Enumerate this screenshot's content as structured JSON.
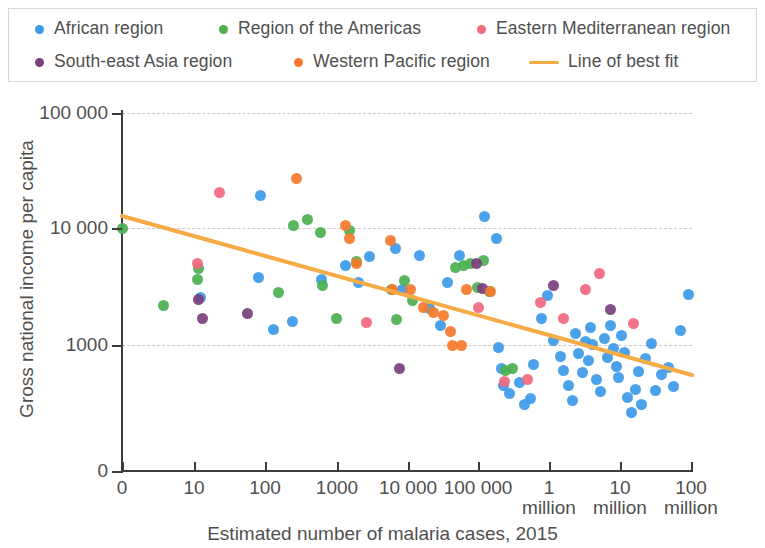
{
  "legend": {
    "items": [
      {
        "label": "African region",
        "color": "#3d9ae8",
        "marker": "dot",
        "name": "legend-item-african-region"
      },
      {
        "label": "Region of the Americas",
        "color": "#4cb050",
        "marker": "dot",
        "name": "legend-item-americas"
      },
      {
        "label": "Eastern Mediterranean region",
        "color": "#f2687f",
        "marker": "dot",
        "name": "legend-item-eastern-mediterranean"
      },
      {
        "label": "South-east Asia region",
        "color": "#7b3f7f",
        "marker": "dot",
        "name": "legend-item-south-east-asia"
      },
      {
        "label": "Western Pacific region",
        "color": "#f5792c",
        "marker": "dot",
        "name": "legend-item-western-pacific"
      },
      {
        "label": "Line of best fit",
        "color": "#f5ab46",
        "marker": "line",
        "name": "legend-item-line-of-best-fit"
      }
    ]
  },
  "chart_data": {
    "type": "scatter",
    "title": "",
    "xlabel": "Estimated number of malaria cases, 2015",
    "ylabel": "Gross national income per capita",
    "x_scale": "log",
    "y_scale": "log",
    "grid": true,
    "legend_position": "top",
    "x_ticks": [
      {
        "label": "0",
        "sub": "",
        "px": 122
      },
      {
        "label": "10",
        "sub": "",
        "px": 194
      },
      {
        "label": "100",
        "sub": "",
        "px": 265
      },
      {
        "label": "1000",
        "sub": "",
        "px": 337
      },
      {
        "label": "10 000",
        "sub": "",
        "px": 408
      },
      {
        "label": "100 000",
        "sub": "",
        "px": 478
      },
      {
        "label": "1",
        "sub": "million",
        "px": 549
      },
      {
        "label": "10",
        "sub": "million",
        "px": 620
      },
      {
        "label": "100",
        "sub": "million",
        "px": 691
      }
    ],
    "y_ticks": [
      {
        "label": "100 000",
        "px": 113
      },
      {
        "label": "10 000",
        "px": 228
      },
      {
        "label": "1000",
        "px": 345
      },
      {
        "label": "0",
        "px": 471
      }
    ],
    "gridlines_y": [
      113,
      228,
      345
    ],
    "line_of_best_fit": {
      "color": "#f5ab46",
      "width": 4,
      "x1": 122,
      "y1": 216,
      "x2": 692,
      "y2": 375
    },
    "series": [
      {
        "name": "African region",
        "color": "#3d9ae8",
        "points": [
          [
            200,
            297
          ],
          [
            260,
            195
          ],
          [
            258,
            277
          ],
          [
            273,
            329
          ],
          [
            292,
            321
          ],
          [
            321,
            279
          ],
          [
            345,
            265
          ],
          [
            358,
            282
          ],
          [
            369,
            256
          ],
          [
            395,
            248
          ],
          [
            402,
            289
          ],
          [
            419,
            255
          ],
          [
            429,
            308
          ],
          [
            440,
            325
          ],
          [
            447,
            282
          ],
          [
            459,
            255
          ],
          [
            484,
            216
          ],
          [
            496,
            238
          ],
          [
            498,
            347
          ],
          [
            501,
            368
          ],
          [
            503,
            385
          ],
          [
            509,
            393
          ],
          [
            519,
            382
          ],
          [
            524,
            404
          ],
          [
            530,
            398
          ],
          [
            533,
            364
          ],
          [
            541,
            318
          ],
          [
            547,
            295
          ],
          [
            553,
            340
          ],
          [
            560,
            356
          ],
          [
            563,
            370
          ],
          [
            568,
            385
          ],
          [
            572,
            400
          ],
          [
            575,
            333
          ],
          [
            578,
            353
          ],
          [
            582,
            372
          ],
          [
            585,
            341
          ],
          [
            588,
            360
          ],
          [
            590,
            327
          ],
          [
            592,
            344
          ],
          [
            596,
            379
          ],
          [
            600,
            391
          ],
          [
            604,
            338
          ],
          [
            607,
            357
          ],
          [
            610,
            325
          ],
          [
            613,
            348
          ],
          [
            616,
            366
          ],
          [
            618,
            377
          ],
          [
            621,
            335
          ],
          [
            624,
            352
          ],
          [
            627,
            397
          ],
          [
            631,
            412
          ],
          [
            635,
            389
          ],
          [
            638,
            371
          ],
          [
            641,
            404
          ],
          [
            645,
            358
          ],
          [
            651,
            343
          ],
          [
            655,
            390
          ],
          [
            661,
            374
          ],
          [
            668,
            367
          ],
          [
            673,
            386
          ],
          [
            680,
            330
          ],
          [
            688,
            294
          ]
        ]
      },
      {
        "name": "Region of the Americas",
        "color": "#4cb050",
        "points": [
          [
            122,
            228
          ],
          [
            163,
            305
          ],
          [
            197,
            279
          ],
          [
            198,
            268
          ],
          [
            278,
            292
          ],
          [
            293,
            225
          ],
          [
            307,
            219
          ],
          [
            320,
            232
          ],
          [
            322,
            285
          ],
          [
            336,
            318
          ],
          [
            349,
            230
          ],
          [
            356,
            261
          ],
          [
            391,
            289
          ],
          [
            396,
            319
          ],
          [
            404,
            280
          ],
          [
            412,
            300
          ],
          [
            455,
            267
          ],
          [
            463,
            265
          ],
          [
            470,
            263
          ],
          [
            477,
            287
          ],
          [
            483,
            260
          ],
          [
            489,
            291
          ],
          [
            505,
            370
          ],
          [
            512,
            368
          ]
        ]
      },
      {
        "name": "Eastern Mediterranean region",
        "color": "#f2687f",
        "points": [
          [
            219,
            192
          ],
          [
            197,
            263
          ],
          [
            366,
            322
          ],
          [
            478,
            307
          ],
          [
            504,
            381
          ],
          [
            527,
            379
          ],
          [
            540,
            302
          ],
          [
            563,
            318
          ],
          [
            585,
            289
          ],
          [
            599,
            273
          ],
          [
            633,
            323
          ]
        ]
      },
      {
        "name": "South-east Asia region",
        "color": "#7b3f7f",
        "points": [
          [
            198,
            299
          ],
          [
            202,
            318
          ],
          [
            247,
            313
          ],
          [
            399,
            368
          ],
          [
            476,
            263
          ],
          [
            482,
            288
          ],
          [
            553,
            285
          ],
          [
            610,
            309
          ]
        ]
      },
      {
        "name": "Western Pacific region",
        "color": "#f5792c",
        "points": [
          [
            296,
            178
          ],
          [
            345,
            225
          ],
          [
            349,
            238
          ],
          [
            356,
            263
          ],
          [
            390,
            240
          ],
          [
            392,
            289
          ],
          [
            410,
            289
          ],
          [
            423,
            307
          ],
          [
            433,
            312
          ],
          [
            443,
            315
          ],
          [
            450,
            331
          ],
          [
            452,
            345
          ],
          [
            461,
            345
          ],
          [
            466,
            289
          ],
          [
            490,
            291
          ]
        ]
      }
    ]
  }
}
